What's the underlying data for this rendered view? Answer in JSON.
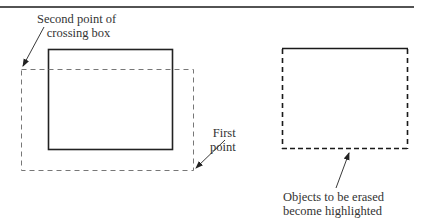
{
  "figure": {
    "type": "diagram",
    "colors": {
      "solid_line": "#222222",
      "dashed_line": "#777777",
      "highlight_dash": "#1a1a1a",
      "text": "#333333",
      "background": "#ffffff"
    }
  },
  "labels": {
    "second_point": {
      "line1": "Second point of",
      "line2": "crossing box"
    },
    "first_point": {
      "line1": "First",
      "line2": "point"
    },
    "objects_erased": {
      "line1": "Objects to be erased",
      "line2": "become highlighted"
    }
  },
  "shapes": {
    "top_rule": {
      "x1": 0,
      "y1": 7,
      "x2": 414,
      "y2": 7
    },
    "object_rectangle": {
      "x": 48,
      "y": 49,
      "width": 124,
      "height": 100,
      "style": "solid"
    },
    "crossing_box": {
      "x": 21,
      "y": 69,
      "width": 172,
      "height": 101,
      "style": "dashed"
    },
    "highlighted_rectangle": {
      "x": 282,
      "y": 48,
      "width": 125,
      "height": 101,
      "style": "dashed-bold"
    }
  }
}
